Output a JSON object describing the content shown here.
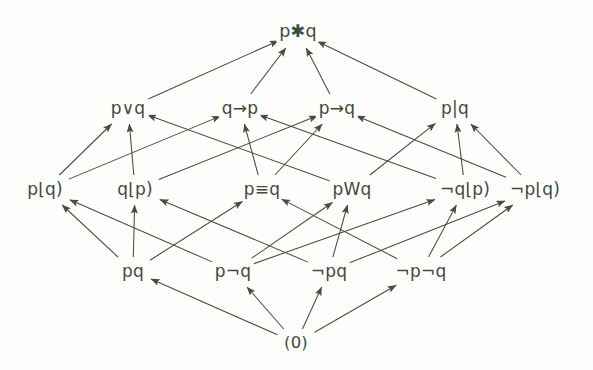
{
  "diagram": {
    "type": "hasse-lattice",
    "background_color": "#fdfdfc",
    "text_color": "#3f4a3f",
    "edge_color": "#4a4a42",
    "levels": [
      {
        "level": 0,
        "name": "top",
        "y": 32,
        "nodes": [
          {
            "id": "top",
            "label": "p✱q",
            "x": 298,
            "y": 32
          }
        ]
      },
      {
        "level": 1,
        "name": "row-disjunctions",
        "y": 108,
        "nodes": [
          {
            "id": "or",
            "label": "p∨q",
            "x": 128,
            "y": 108
          },
          {
            "id": "qimpp",
            "label": "q→p",
            "x": 240,
            "y": 108
          },
          {
            "id": "pimpq",
            "label": "p→q",
            "x": 337,
            "y": 108
          },
          {
            "id": "nand",
            "label": "p|q",
            "x": 455,
            "y": 108
          }
        ]
      },
      {
        "level": 2,
        "name": "row-binary-middles",
        "y": 189,
        "nodes": [
          {
            "id": "pleftq",
            "label": "p⌊q)",
            "x": 45,
            "y": 189
          },
          {
            "id": "qleftp",
            "label": "q⌊p)",
            "x": 135,
            "y": 189
          },
          {
            "id": "equiv",
            "label": "p≡q",
            "x": 262,
            "y": 189
          },
          {
            "id": "pwq",
            "label": "pWq",
            "x": 352,
            "y": 189
          },
          {
            "id": "nqleftp",
            "label": "¬q⌊p)",
            "x": 465,
            "y": 189
          },
          {
            "id": "npleftq",
            "label": "¬p⌊q)",
            "x": 535,
            "y": 189
          }
        ]
      },
      {
        "level": 3,
        "name": "row-conjunctions",
        "y": 271,
        "nodes": [
          {
            "id": "pq",
            "label": "pq",
            "x": 133,
            "y": 271
          },
          {
            "id": "pnq",
            "label": "p¬q",
            "x": 233,
            "y": 271
          },
          {
            "id": "npq",
            "label": "¬pq",
            "x": 329,
            "y": 271
          },
          {
            "id": "npnq",
            "label": "¬p¬q",
            "x": 421,
            "y": 271
          }
        ]
      },
      {
        "level": 4,
        "name": "bottom",
        "y": 343,
        "nodes": [
          {
            "id": "zero",
            "label": "(0)",
            "x": 296,
            "y": 343
          }
        ]
      }
    ],
    "edges": [
      {
        "from": "zero",
        "to": "pq"
      },
      {
        "from": "zero",
        "to": "pnq"
      },
      {
        "from": "zero",
        "to": "npq"
      },
      {
        "from": "zero",
        "to": "npnq"
      },
      {
        "from": "pq",
        "to": "pleftq"
      },
      {
        "from": "pq",
        "to": "qleftp"
      },
      {
        "from": "pq",
        "to": "equiv"
      },
      {
        "from": "pnq",
        "to": "pleftq"
      },
      {
        "from": "pnq",
        "to": "pwq"
      },
      {
        "from": "pnq",
        "to": "nqleftp"
      },
      {
        "from": "npq",
        "to": "qleftp"
      },
      {
        "from": "npq",
        "to": "pwq"
      },
      {
        "from": "npq",
        "to": "npleftq"
      },
      {
        "from": "npnq",
        "to": "equiv"
      },
      {
        "from": "npnq",
        "to": "nqleftp"
      },
      {
        "from": "npnq",
        "to": "npleftq"
      },
      {
        "from": "pleftq",
        "to": "or"
      },
      {
        "from": "pleftq",
        "to": "qimpp"
      },
      {
        "from": "qleftp",
        "to": "or"
      },
      {
        "from": "qleftp",
        "to": "pimpq"
      },
      {
        "from": "equiv",
        "to": "qimpp"
      },
      {
        "from": "equiv",
        "to": "pimpq"
      },
      {
        "from": "pwq",
        "to": "or"
      },
      {
        "from": "pwq",
        "to": "nand"
      },
      {
        "from": "nqleftp",
        "to": "qimpp"
      },
      {
        "from": "nqleftp",
        "to": "nand"
      },
      {
        "from": "npleftq",
        "to": "pimpq"
      },
      {
        "from": "npleftq",
        "to": "nand"
      },
      {
        "from": "or",
        "to": "top"
      },
      {
        "from": "qimpp",
        "to": "top"
      },
      {
        "from": "pimpq",
        "to": "top"
      },
      {
        "from": "nand",
        "to": "top"
      }
    ]
  }
}
